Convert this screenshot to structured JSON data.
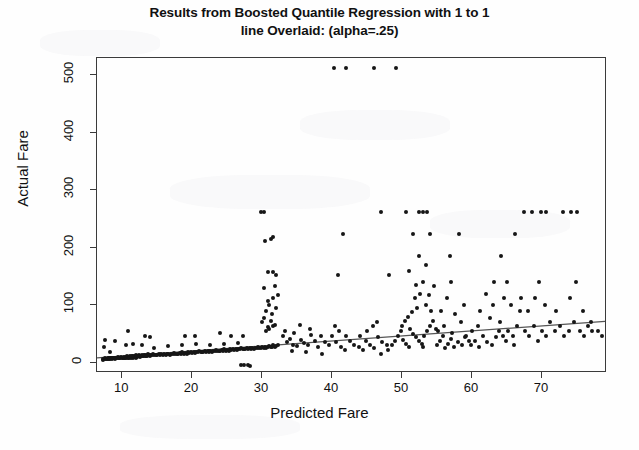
{
  "chart_data": {
    "type": "scatter",
    "title": "Results from Boosted Quantile Regression with 1 to 1 line Overlaid: (alpha=.25)",
    "title_line1": "Results from Boosted Quantile Regression with 1 to 1",
    "title_line2": "line Overlaid: (alpha=.25)",
    "xlabel": "Predicted Fare",
    "ylabel": "Actual Fare",
    "xlim": [
      6.4,
      79.3
    ],
    "ylim": [
      -18,
      530
    ],
    "xticks": [
      10,
      20,
      30,
      40,
      50,
      60,
      70
    ],
    "yticks": [
      0,
      100,
      200,
      300,
      400,
      500
    ],
    "grid": false,
    "legend": null,
    "point_color": "#161616",
    "line_color": "#555555",
    "overlay_line": {
      "label": "1 to 1 line overlaid",
      "x": [
        6.4,
        79.3
      ],
      "y": [
        5.0,
        69.0
      ]
    },
    "points": [
      [
        7.2,
        4
      ],
      [
        7.3,
        7
      ],
      [
        7.5,
        7
      ],
      [
        7.6,
        8
      ],
      [
        7.7,
        7
      ],
      [
        7.8,
        7
      ],
      [
        7.9,
        8
      ],
      [
        8.0,
        7
      ],
      [
        8.05,
        7
      ],
      [
        8.1,
        8
      ],
      [
        8.2,
        8
      ],
      [
        8.3,
        7
      ],
      [
        8.4,
        9
      ],
      [
        8.5,
        8
      ],
      [
        8.6,
        7
      ],
      [
        8.7,
        8
      ],
      [
        8.8,
        8
      ],
      [
        8.9,
        7
      ],
      [
        9.0,
        9
      ],
      [
        9.1,
        8
      ],
      [
        7.4,
        27
      ],
      [
        7.6,
        39
      ],
      [
        8.2,
        18
      ],
      [
        9.3,
        8
      ],
      [
        9.4,
        10
      ],
      [
        9.5,
        8
      ],
      [
        9.6,
        9
      ],
      [
        9.7,
        8
      ],
      [
        9.8,
        10
      ],
      [
        9.9,
        8
      ],
      [
        10.1,
        9
      ],
      [
        10.2,
        8
      ],
      [
        10.3,
        10
      ],
      [
        10.4,
        9
      ],
      [
        10.5,
        10
      ],
      [
        10.6,
        8
      ],
      [
        10.7,
        11
      ],
      [
        10.8,
        9
      ],
      [
        10.9,
        10
      ],
      [
        11.0,
        9
      ],
      [
        11.1,
        12
      ],
      [
        11.2,
        9
      ],
      [
        11.3,
        10
      ],
      [
        11.4,
        11
      ],
      [
        11.5,
        9
      ],
      [
        11.6,
        12
      ],
      [
        11.7,
        10
      ],
      [
        11.8,
        11
      ],
      [
        11.9,
        9
      ],
      [
        12.0,
        13
      ],
      [
        12.1,
        10
      ],
      [
        12.2,
        12
      ],
      [
        12.3,
        11
      ],
      [
        12.4,
        13
      ],
      [
        12.5,
        10
      ],
      [
        12.6,
        12
      ],
      [
        12.7,
        11
      ],
      [
        12.8,
        14
      ],
      [
        12.9,
        12
      ],
      [
        13.0,
        11
      ],
      [
        13.1,
        13
      ],
      [
        13.2,
        12
      ],
      [
        13.3,
        14
      ],
      [
        13.4,
        11
      ],
      [
        13.5,
        13
      ],
      [
        13.6,
        12
      ],
      [
        13.7,
        15
      ],
      [
        13.8,
        13
      ],
      [
        13.9,
        12
      ],
      [
        14.0,
        14
      ],
      [
        14.2,
        13
      ],
      [
        14.4,
        15
      ],
      [
        14.6,
        13
      ],
      [
        14.8,
        14
      ],
      [
        15.0,
        13
      ],
      [
        15.2,
        15
      ],
      [
        15.4,
        14
      ],
      [
        15.6,
        16
      ],
      [
        15.8,
        14
      ],
      [
        16.0,
        15
      ],
      [
        16.2,
        13
      ],
      [
        16.4,
        16
      ],
      [
        16.6,
        15
      ],
      [
        16.8,
        14
      ],
      [
        17.0,
        16
      ],
      [
        17.2,
        15
      ],
      [
        17.4,
        17
      ],
      [
        17.6,
        15
      ],
      [
        17.8,
        16
      ],
      [
        18.0,
        15
      ],
      [
        18.2,
        17
      ],
      [
        18.4,
        16
      ],
      [
        18.6,
        18
      ],
      [
        18.8,
        16
      ],
      [
        19.0,
        17
      ],
      [
        19.2,
        16
      ],
      [
        19.4,
        18
      ],
      [
        19.6,
        17
      ],
      [
        19.8,
        19
      ],
      [
        20.0,
        17
      ],
      [
        20.2,
        18
      ],
      [
        20.4,
        17
      ],
      [
        20.6,
        19
      ],
      [
        20.8,
        18
      ],
      [
        21.0,
        20
      ],
      [
        21.2,
        18
      ],
      [
        21.4,
        19
      ],
      [
        21.6,
        18
      ],
      [
        21.8,
        20
      ],
      [
        22.0,
        19
      ],
      [
        22.2,
        21
      ],
      [
        22.4,
        19
      ],
      [
        22.6,
        20
      ],
      [
        22.8,
        19
      ],
      [
        23.0,
        21
      ],
      [
        23.2,
        20
      ],
      [
        23.4,
        22
      ],
      [
        23.6,
        20
      ],
      [
        23.8,
        21
      ],
      [
        24.0,
        20
      ],
      [
        24.2,
        22
      ],
      [
        24.4,
        21
      ],
      [
        24.6,
        23
      ],
      [
        24.8,
        21
      ],
      [
        25.0,
        22
      ],
      [
        25.2,
        21
      ],
      [
        25.4,
        23
      ],
      [
        25.6,
        22
      ],
      [
        25.8,
        24
      ],
      [
        26.0,
        22
      ],
      [
        26.2,
        23
      ],
      [
        26.4,
        22
      ],
      [
        26.6,
        24
      ],
      [
        26.8,
        23
      ],
      [
        27.0,
        25
      ],
      [
        27.2,
        23
      ],
      [
        27.4,
        24
      ],
      [
        27.6,
        23
      ],
      [
        27.8,
        25
      ],
      [
        28.0,
        24
      ],
      [
        28.2,
        26
      ],
      [
        28.4,
        24
      ],
      [
        28.6,
        25
      ],
      [
        28.8,
        24
      ],
      [
        29.0,
        26
      ],
      [
        29.2,
        25
      ],
      [
        29.4,
        27
      ],
      [
        29.6,
        25
      ],
      [
        29.8,
        26
      ],
      [
        30.0,
        27
      ],
      [
        30.2,
        26
      ],
      [
        30.4,
        28
      ],
      [
        30.6,
        26
      ],
      [
        30.8,
        27
      ],
      [
        31.0,
        29
      ],
      [
        31.2,
        27
      ],
      [
        31.4,
        28
      ],
      [
        31.6,
        30
      ],
      [
        31.8,
        28
      ],
      [
        32.0,
        29
      ],
      [
        32.2,
        31
      ],
      [
        10.5,
        31
      ],
      [
        11.5,
        32
      ],
      [
        12.8,
        30
      ],
      [
        14.5,
        26
      ],
      [
        16.5,
        29
      ],
      [
        18.5,
        31
      ],
      [
        20.5,
        33
      ],
      [
        22.5,
        30
      ],
      [
        24.5,
        33
      ],
      [
        26.5,
        35
      ],
      [
        13.2,
        46
      ],
      [
        14.0,
        45
      ],
      [
        19.0,
        46
      ],
      [
        20.4,
        46
      ],
      [
        25.5,
        47
      ],
      [
        27.2,
        47
      ],
      [
        24.0,
        52
      ],
      [
        9.0,
        38
      ],
      [
        10.8,
        55
      ],
      [
        27.0,
        -4
      ],
      [
        27.4,
        -4
      ],
      [
        28.0,
        -4
      ],
      [
        28.3,
        -5
      ],
      [
        30.5,
        55
      ],
      [
        30.8,
        62
      ],
      [
        31.0,
        58
      ],
      [
        31.5,
        63
      ],
      [
        30.0,
        70
      ],
      [
        31.2,
        72
      ],
      [
        31.8,
        66
      ],
      [
        30.3,
        78
      ],
      [
        31.4,
        85
      ],
      [
        30.6,
        90
      ],
      [
        32.0,
        95
      ],
      [
        31.0,
        100
      ],
      [
        30.8,
        108
      ],
      [
        31.6,
        112
      ],
      [
        32.2,
        118
      ],
      [
        30.2,
        130
      ],
      [
        31.8,
        134
      ],
      [
        32.0,
        152
      ],
      [
        30.9,
        158
      ],
      [
        31.6,
        158
      ],
      [
        30.4,
        212
      ],
      [
        31.2,
        216
      ],
      [
        31.6,
        218
      ],
      [
        29.8,
        263
      ],
      [
        30.3,
        263
      ],
      [
        33.0,
        46
      ],
      [
        33.5,
        36
      ],
      [
        34.0,
        41
      ],
      [
        34.4,
        31
      ],
      [
        35.0,
        29
      ],
      [
        35.5,
        39
      ],
      [
        36.0,
        35
      ],
      [
        36.5,
        30
      ],
      [
        37.0,
        48
      ],
      [
        37.5,
        38
      ],
      [
        38.0,
        27
      ],
      [
        33.2,
        56
      ],
      [
        34.6,
        52
      ],
      [
        35.4,
        66
      ],
      [
        36.8,
        58
      ],
      [
        38.4,
        46
      ],
      [
        39.0,
        36
      ],
      [
        39.6,
        30
      ],
      [
        34.2,
        21
      ],
      [
        36.2,
        19
      ],
      [
        38.6,
        16
      ],
      [
        40.0,
        46
      ],
      [
        40.6,
        36
      ],
      [
        41.2,
        28
      ],
      [
        41.8,
        22
      ],
      [
        40.4,
        63
      ],
      [
        41.0,
        56
      ],
      [
        42.0,
        46
      ],
      [
        42.6,
        38
      ],
      [
        43.2,
        31
      ],
      [
        43.8,
        27
      ],
      [
        44.4,
        22
      ],
      [
        40.2,
        512
      ],
      [
        42.0,
        512
      ],
      [
        46.0,
        512
      ],
      [
        49.2,
        512
      ],
      [
        41.6,
        224
      ],
      [
        40.8,
        152
      ],
      [
        44.0,
        46
      ],
      [
        44.8,
        38
      ],
      [
        45.4,
        30
      ],
      [
        46.0,
        25
      ],
      [
        46.6,
        45
      ],
      [
        47.2,
        36
      ],
      [
        47.8,
        30
      ],
      [
        45.0,
        56
      ],
      [
        45.8,
        63
      ],
      [
        46.4,
        70
      ],
      [
        47.0,
        16
      ],
      [
        48.0,
        22
      ],
      [
        48.6,
        30
      ],
      [
        49.0,
        38
      ],
      [
        48.2,
        152
      ],
      [
        47.0,
        263
      ],
      [
        49.4,
        46
      ],
      [
        49.8,
        56
      ],
      [
        50.2,
        40
      ],
      [
        50.6,
        33
      ],
      [
        51.0,
        28
      ],
      [
        50.0,
        63
      ],
      [
        50.4,
        72
      ],
      [
        50.8,
        80
      ],
      [
        51.2,
        58
      ],
      [
        51.6,
        50
      ],
      [
        52.0,
        44
      ],
      [
        52.4,
        38
      ],
      [
        52.8,
        33
      ],
      [
        53.0,
        28
      ],
      [
        53.2,
        46
      ],
      [
        53.6,
        56
      ],
      [
        54.0,
        63
      ],
      [
        54.4,
        72
      ],
      [
        54.8,
        58
      ],
      [
        51.4,
        88
      ],
      [
        52.2,
        95
      ],
      [
        53.4,
        100
      ],
      [
        54.2,
        90
      ],
      [
        51.8,
        112
      ],
      [
        52.6,
        120
      ],
      [
        53.8,
        118
      ],
      [
        52.0,
        136
      ],
      [
        53.0,
        140
      ],
      [
        54.6,
        134
      ],
      [
        51.0,
        160
      ],
      [
        53.4,
        170
      ],
      [
        52.4,
        185
      ],
      [
        51.6,
        224
      ],
      [
        54.0,
        224
      ],
      [
        50.6,
        263
      ],
      [
        52.4,
        263
      ],
      [
        53.0,
        263
      ],
      [
        53.6,
        263
      ],
      [
        55.0,
        30
      ],
      [
        55.4,
        38
      ],
      [
        55.8,
        46
      ],
      [
        56.2,
        25
      ],
      [
        56.6,
        33
      ],
      [
        57.0,
        41
      ],
      [
        57.4,
        28
      ],
      [
        55.2,
        56
      ],
      [
        56.0,
        63
      ],
      [
        57.2,
        52
      ],
      [
        58.0,
        36
      ],
      [
        58.6,
        30
      ],
      [
        59.0,
        44
      ],
      [
        59.6,
        38
      ],
      [
        55.6,
        90
      ],
      [
        57.6,
        84
      ],
      [
        58.4,
        70
      ],
      [
        56.4,
        112
      ],
      [
        58.8,
        100
      ],
      [
        57.0,
        140
      ],
      [
        56.8,
        185
      ],
      [
        58.2,
        224
      ],
      [
        59.2,
        46
      ],
      [
        59.8,
        30
      ],
      [
        60.4,
        38
      ],
      [
        61.0,
        28
      ],
      [
        60.0,
        56
      ],
      [
        60.8,
        63
      ],
      [
        61.6,
        46
      ],
      [
        62.2,
        36
      ],
      [
        62.8,
        30
      ],
      [
        63.4,
        44
      ],
      [
        61.2,
        90
      ],
      [
        62.6,
        78
      ],
      [
        63.0,
        100
      ],
      [
        62.0,
        120
      ],
      [
        63.8,
        56
      ],
      [
        64.4,
        46
      ],
      [
        64.0,
        70
      ],
      [
        64.8,
        38
      ],
      [
        65.2,
        56
      ],
      [
        65.8,
        46
      ],
      [
        66.4,
        63
      ],
      [
        66.0,
        30
      ],
      [
        63.2,
        140
      ],
      [
        64.6,
        112
      ],
      [
        65.6,
        100
      ],
      [
        66.8,
        90
      ],
      [
        65.0,
        140
      ],
      [
        67.0,
        112
      ],
      [
        64.2,
        185
      ],
      [
        66.2,
        224
      ],
      [
        67.6,
        56
      ],
      [
        68.2,
        46
      ],
      [
        68.8,
        63
      ],
      [
        69.4,
        38
      ],
      [
        68.0,
        90
      ],
      [
        69.0,
        112
      ],
      [
        70.0,
        56
      ],
      [
        70.6,
        46
      ],
      [
        71.2,
        70
      ],
      [
        71.8,
        56
      ],
      [
        69.6,
        140
      ],
      [
        70.4,
        100
      ],
      [
        72.0,
        90
      ],
      [
        72.6,
        63
      ],
      [
        73.2,
        46
      ],
      [
        73.8,
        56
      ],
      [
        67.4,
        263
      ],
      [
        68.6,
        263
      ],
      [
        69.8,
        263
      ],
      [
        70.6,
        263
      ],
      [
        73.0,
        263
      ],
      [
        74.2,
        263
      ],
      [
        75.0,
        263
      ],
      [
        74.6,
        70
      ],
      [
        75.4,
        56
      ],
      [
        76.0,
        46
      ],
      [
        76.6,
        63
      ],
      [
        77.2,
        56
      ],
      [
        74.0,
        112
      ],
      [
        75.8,
        90
      ],
      [
        77.0,
        70
      ],
      [
        78.0,
        56
      ],
      [
        78.6,
        46
      ],
      [
        74.8,
        140
      ]
    ]
  }
}
